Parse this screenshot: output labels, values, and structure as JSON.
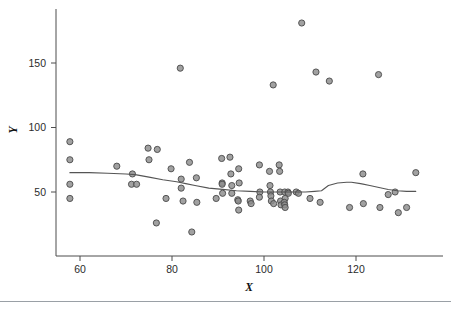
{
  "figure": {
    "background": "#ffffff",
    "marker_fill": "#8c8c8c",
    "marker_stroke": "#4a4a4a",
    "line_color": "#555555",
    "axis_color": "#4d4d4d"
  },
  "labels": {
    "x_axis_title": "X",
    "y_axis_title": "Y"
  },
  "chart_data": {
    "type": "scatter",
    "title": "",
    "xlabel": "X",
    "ylabel": "Y",
    "xlim": [
      55,
      135
    ],
    "ylim": [
      15,
      190
    ],
    "grid": false,
    "legend": null,
    "xticks": [
      60,
      80,
      100,
      120
    ],
    "yticks": [
      50,
      100,
      150
    ],
    "xtick_labels": [
      "60",
      "80",
      "100",
      "120"
    ],
    "ytick_labels": [
      "50",
      "100",
      "150"
    ],
    "points": [
      [
        57.8,
        89
      ],
      [
        57.8,
        75
      ],
      [
        57.8,
        56
      ],
      [
        57.8,
        45
      ],
      [
        68.0,
        70
      ],
      [
        71.4,
        64
      ],
      [
        71.2,
        56
      ],
      [
        72.3,
        56
      ],
      [
        74.8,
        84
      ],
      [
        75.0,
        75
      ],
      [
        76.8,
        83
      ],
      [
        76.6,
        26
      ],
      [
        78.7,
        45
      ],
      [
        79.8,
        68
      ],
      [
        81.8,
        146
      ],
      [
        82.0,
        60
      ],
      [
        82.0,
        53
      ],
      [
        82.4,
        43
      ],
      [
        83.8,
        73
      ],
      [
        84.3,
        19
      ],
      [
        85.3,
        61
      ],
      [
        85.4,
        42
      ],
      [
        89.6,
        45
      ],
      [
        90.8,
        76
      ],
      [
        90.9,
        57
      ],
      [
        90.9,
        56
      ],
      [
        91.0,
        49
      ],
      [
        92.6,
        77
      ],
      [
        92.8,
        64
      ],
      [
        93.0,
        55
      ],
      [
        93.0,
        49
      ],
      [
        94.5,
        68
      ],
      [
        94.6,
        57
      ],
      [
        94.3,
        44
      ],
      [
        94.4,
        43
      ],
      [
        94.5,
        36
      ],
      [
        97.0,
        43
      ],
      [
        97.2,
        41
      ],
      [
        99.0,
        71
      ],
      [
        99.1,
        50
      ],
      [
        99.0,
        46
      ],
      [
        101.2,
        66
      ],
      [
        101.3,
        55
      ],
      [
        101.4,
        50
      ],
      [
        101.5,
        47
      ],
      [
        101.6,
        43
      ],
      [
        102.0,
        133
      ],
      [
        102.1,
        41
      ],
      [
        103.3,
        71
      ],
      [
        103.4,
        66
      ],
      [
        103.5,
        50
      ],
      [
        103.6,
        43
      ],
      [
        103.7,
        40
      ],
      [
        104.5,
        50
      ],
      [
        104.6,
        45
      ],
      [
        104.4,
        42
      ],
      [
        104.5,
        40
      ],
      [
        104.6,
        38
      ],
      [
        105.2,
        50
      ],
      [
        105.3,
        49
      ],
      [
        107.0,
        50
      ],
      [
        107.5,
        49
      ],
      [
        108.2,
        181
      ],
      [
        110.0,
        45
      ],
      [
        111.3,
        143
      ],
      [
        112.2,
        42
      ],
      [
        114.2,
        136
      ],
      [
        118.6,
        38
      ],
      [
        121.5,
        64
      ],
      [
        121.6,
        41
      ],
      [
        124.9,
        141
      ],
      [
        125.2,
        38
      ],
      [
        127.0,
        48
      ],
      [
        128.5,
        50
      ],
      [
        129.2,
        34
      ],
      [
        131.0,
        38
      ],
      [
        133.0,
        65
      ]
    ],
    "smooth_curve": {
      "name": "loess smoother",
      "x": [
        57.8,
        62,
        66,
        70,
        72,
        75,
        78,
        81,
        83,
        85,
        88,
        91,
        94,
        97,
        100,
        103,
        106,
        109,
        111,
        112.5,
        114,
        116,
        118,
        119,
        121,
        123,
        125,
        127,
        129,
        131,
        133
      ],
      "y": [
        65,
        65,
        64.5,
        64,
        63.5,
        61.5,
        59.5,
        58,
        56.5,
        55,
        53,
        52,
        51,
        50.5,
        50,
        50,
        50,
        50,
        50.5,
        51,
        55,
        57,
        57.5,
        57.5,
        56.5,
        55,
        53.5,
        52,
        51,
        50.5,
        50.5
      ]
    }
  }
}
